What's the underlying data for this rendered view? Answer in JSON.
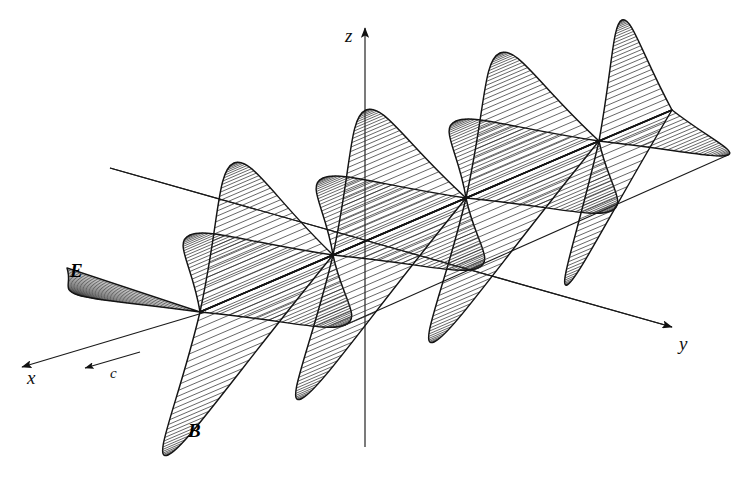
{
  "figure": {
    "background_color": "#ffffff",
    "ink_color": "#111111",
    "width": 740,
    "height": 482
  },
  "axes": [
    {
      "id": "x",
      "label": "x",
      "label_x": 27,
      "label_y": 384,
      "from": [
        206,
        312
      ],
      "to": [
        22,
        367
      ],
      "arrow": true
    },
    {
      "id": "y",
      "label": "y",
      "label_x": 679,
      "label_y": 350,
      "from": [
        110,
        168
      ],
      "to": [
        672,
        327
      ],
      "arrow": true
    },
    {
      "id": "z",
      "label": "z",
      "label_x": 345,
      "label_y": 42,
      "from": [
        365,
        447
      ],
      "to": [
        365,
        28
      ],
      "arrow": true
    }
  ],
  "vectors": [
    {
      "id": "c",
      "label": "c",
      "label_x": 110,
      "label_y": 378,
      "from": [
        140,
        352
      ],
      "to": [
        85,
        368
      ],
      "arrow": true,
      "description": "propagation direction"
    }
  ],
  "field_labels": [
    {
      "id": "E",
      "label": "E",
      "x": 70,
      "y": 277,
      "field": "electric"
    },
    {
      "id": "B",
      "label": "B",
      "x": 188,
      "y": 437,
      "field": "magnetic"
    }
  ],
  "chart_data": {
    "type": "line",
    "xlabel": "y",
    "ylabel": "field amplitude",
    "series": [
      {
        "name": "B",
        "axis": "z",
        "hatch": "vertical",
        "label": "B",
        "lobes": [
          {
            "index": 0,
            "sign": -1,
            "node_from": [
              200,
              312
            ],
            "node_to": [
              333,
              255
            ],
            "tip": [
              168,
              455
            ],
            "amplitude": 143
          },
          {
            "index": 1,
            "sign": 1,
            "node_from": [
              200,
              312
            ],
            "node_to": [
              333,
              255
            ],
            "tip": [
              234,
              163
            ],
            "amplitude": 143
          },
          {
            "index": 2,
            "sign": -1,
            "node_from": [
              333,
              255
            ],
            "node_to": [
              466,
              198
            ],
            "tip": [
              301,
              399
            ],
            "amplitude": 143
          },
          {
            "index": 3,
            "sign": 1,
            "node_from": [
              333,
              255
            ],
            "node_to": [
              466,
              198
            ],
            "tip": [
              366,
              110
            ],
            "amplitude": 143
          },
          {
            "index": 4,
            "sign": -1,
            "node_from": [
              466,
              198
            ],
            "node_to": [
              599,
              141
            ],
            "tip": [
              434,
              342
            ],
            "amplitude": 143
          },
          {
            "index": 5,
            "sign": 1,
            "node_from": [
              466,
              198
            ],
            "node_to": [
              599,
              141
            ],
            "tip": [
              500,
              53
            ],
            "amplitude": 143
          },
          {
            "index": 6,
            "sign": -1,
            "node_from": [
              599,
              141
            ],
            "node_to": [
              672,
              110
            ],
            "tip": [
              567,
              285
            ],
            "amplitude": 143
          },
          {
            "index": 7,
            "sign": 1,
            "node_from": [
              599,
              141
            ],
            "node_to": [
              672,
              110
            ],
            "tip": [
              622,
              20
            ],
            "amplitude": 120
          }
        ]
      },
      {
        "name": "E",
        "axis": "x",
        "hatch": "slanted",
        "label": "E",
        "lobes": [
          {
            "index": 0,
            "sign": 1,
            "node_from": [
              67,
              268
            ],
            "node_to": [
              200,
              312
            ],
            "tip": [
              78,
              295
            ],
            "amplitude": 128
          },
          {
            "index": 1,
            "sign": -1,
            "node_from": [
              200,
              312
            ],
            "node_to": [
              333,
              255
            ],
            "tip": [
              345,
              325
            ],
            "amplitude": 128
          },
          {
            "index": 2,
            "sign": 1,
            "node_from": [
              200,
              312
            ],
            "node_to": [
              333,
              255
            ],
            "tip": [
              190,
              235
            ],
            "amplitude": 128
          },
          {
            "index": 3,
            "sign": -1,
            "node_from": [
              333,
              255
            ],
            "node_to": [
              466,
              198
            ],
            "tip": [
              478,
              268
            ],
            "amplitude": 128
          },
          {
            "index": 4,
            "sign": 1,
            "node_from": [
              333,
              255
            ],
            "node_to": [
              466,
              198
            ],
            "tip": [
              323,
              178
            ],
            "amplitude": 128
          },
          {
            "index": 5,
            "sign": -1,
            "node_from": [
              466,
              198
            ],
            "node_to": [
              599,
              141
            ],
            "tip": [
              611,
              211
            ],
            "amplitude": 128
          },
          {
            "index": 6,
            "sign": 1,
            "node_from": [
              466,
              198
            ],
            "node_to": [
              599,
              141
            ],
            "tip": [
              456,
              121
            ],
            "amplitude": 128
          },
          {
            "index": 7,
            "sign": -1,
            "node_from": [
              599,
              141
            ],
            "node_to": [
              672,
              110
            ],
            "tip": [
              728,
              155
            ],
            "amplitude": 128
          }
        ]
      }
    ],
    "nodes": [
      [
        67,
        268
      ],
      [
        200,
        312
      ],
      [
        333,
        255
      ],
      [
        466,
        198
      ],
      [
        599,
        141
      ],
      [
        672,
        110
      ]
    ],
    "envelope_lines": [
      {
        "name": "B-crest-envelope",
        "from": [
          110,
          168
        ],
        "to": [
          672,
          327
        ]
      },
      {
        "name": "E-tip-envelope-lower",
        "from": [
          345,
          325
        ],
        "to": [
          728,
          155
        ]
      }
    ],
    "grid": false,
    "legend": "none"
  }
}
